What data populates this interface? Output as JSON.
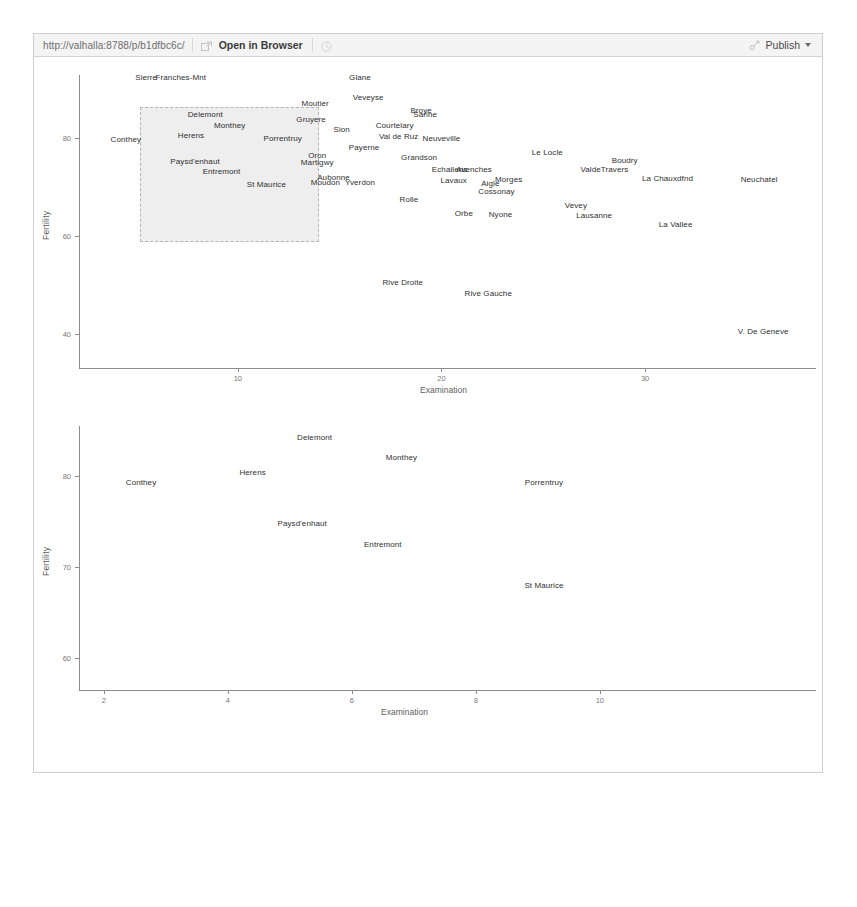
{
  "toolbar": {
    "url": "http://valhalla:8788/p/b1dfbc6c/",
    "open_in_browser_label": "Open in Browser",
    "publish_label": "Publish",
    "back_icon": "back-arrow-icon",
    "popout_icon": "popout-icon",
    "broom_icon": "broom-clear-icon",
    "publish_icon": "publish-icon",
    "caret_icon": "chevron-down-icon"
  },
  "charts": [
    {
      "id": "fertility-vs-examination-full",
      "type": "scatter",
      "title": "",
      "xlabel": "Examination",
      "ylabel": "Fertility",
      "xlim": [
        2.2,
        38.0
      ],
      "ylim": [
        33.0,
        93.0
      ],
      "xticks": [
        "10",
        "20",
        "30"
      ],
      "xtick_values": [
        10,
        20,
        30
      ],
      "yticks": [
        "80",
        "60",
        "40"
      ],
      "ytick_values": [
        80,
        60,
        40
      ],
      "grid": false,
      "legend": "none",
      "brush": {
        "x0": 5.2,
        "x1": 14.0,
        "y0": 58.9,
        "y1": 86.5
      },
      "points": [
        {
          "label": "Sierre",
          "x": 5.5,
          "y": 92.5
        },
        {
          "label": "Franches-Mnt",
          "x": 7.2,
          "y": 92.5
        },
        {
          "label": "Glane",
          "x": 16.0,
          "y": 92.5
        },
        {
          "label": "Moutier",
          "x": 13.8,
          "y": 87.2
        },
        {
          "label": "Veveyse",
          "x": 16.4,
          "y": 88.5
        },
        {
          "label": "Delemont",
          "x": 8.4,
          "y": 85.0
        },
        {
          "label": "Broye",
          "x": 19.0,
          "y": 85.9
        },
        {
          "label": "Sarine",
          "x": 19.2,
          "y": 85.1
        },
        {
          "label": "Gruyere",
          "x": 13.6,
          "y": 84.0
        },
        {
          "label": "Monthey",
          "x": 9.6,
          "y": 82.7
        },
        {
          "label": "Sion",
          "x": 15.1,
          "y": 82.0
        },
        {
          "label": "Courtelary",
          "x": 17.7,
          "y": 82.7
        },
        {
          "label": "Herens",
          "x": 7.7,
          "y": 80.8
        },
        {
          "label": "Val de Ruz",
          "x": 17.9,
          "y": 80.6
        },
        {
          "label": "Neuveville",
          "x": 20.0,
          "y": 80.1
        },
        {
          "label": "Conthey",
          "x": 4.5,
          "y": 79.8
        },
        {
          "label": "Porrentruy",
          "x": 12.2,
          "y": 80.1
        },
        {
          "label": "Payerne",
          "x": 16.2,
          "y": 78.3
        },
        {
          "label": "Oron",
          "x": 13.9,
          "y": 76.6
        },
        {
          "label": "Grandson",
          "x": 18.9,
          "y": 76.3
        },
        {
          "label": "Le Locle",
          "x": 25.2,
          "y": 77.3
        },
        {
          "label": "Martigwy",
          "x": 13.9,
          "y": 75.2
        },
        {
          "label": "Boudry",
          "x": 29.0,
          "y": 75.5
        },
        {
          "label": "Paysd'enhaut",
          "x": 7.9,
          "y": 75.3
        },
        {
          "label": "Echallens",
          "x": 20.4,
          "y": 73.8
        },
        {
          "label": "Avenches",
          "x": 21.6,
          "y": 73.8
        },
        {
          "label": "ValdeTravers",
          "x": 28.0,
          "y": 73.8
        },
        {
          "label": "Entremont",
          "x": 9.2,
          "y": 73.4
        },
        {
          "label": "Aubonne",
          "x": 14.7,
          "y": 72.2
        },
        {
          "label": "Moudon",
          "x": 14.3,
          "y": 71.1
        },
        {
          "label": "Yverdon",
          "x": 16.0,
          "y": 71.1
        },
        {
          "label": "Lavaux",
          "x": 20.6,
          "y": 71.5
        },
        {
          "label": "Morges",
          "x": 23.3,
          "y": 71.8
        },
        {
          "label": "Aigle",
          "x": 22.4,
          "y": 70.8
        },
        {
          "label": "La Chauxdfnd",
          "x": 31.1,
          "y": 72.0
        },
        {
          "label": "Neuchatel",
          "x": 35.6,
          "y": 71.8
        },
        {
          "label": "St Maurice",
          "x": 11.4,
          "y": 70.6
        },
        {
          "label": "Cossonay",
          "x": 22.7,
          "y": 69.2
        },
        {
          "label": "Rolle",
          "x": 18.4,
          "y": 67.7
        },
        {
          "label": "Vevey",
          "x": 26.6,
          "y": 66.3
        },
        {
          "label": "Orbe",
          "x": 21.1,
          "y": 64.8
        },
        {
          "label": "Nyone",
          "x": 22.9,
          "y": 64.5
        },
        {
          "label": "Lausanne",
          "x": 27.5,
          "y": 64.3
        },
        {
          "label": "La Vallee",
          "x": 31.5,
          "y": 62.5
        },
        {
          "label": "Rive Droite",
          "x": 18.1,
          "y": 50.6
        },
        {
          "label": "Rive Gauche",
          "x": 22.3,
          "y": 48.3
        },
        {
          "label": "V. De Geneve",
          "x": 35.8,
          "y": 40.6
        }
      ]
    },
    {
      "id": "fertility-vs-examination-zoom",
      "type": "scatter",
      "title": "",
      "xlabel": "Examination",
      "ylabel": "Fertility",
      "xlim": [
        1.6,
        12.1
      ],
      "ylim": [
        56.5,
        85.5
      ],
      "xticks": [
        "2",
        "4",
        "6",
        "8",
        "10"
      ],
      "xtick_values": [
        2,
        4,
        6,
        8,
        10
      ],
      "yticks": [
        "80",
        "70",
        "60"
      ],
      "ytick_values": [
        80,
        70,
        60
      ],
      "grid": false,
      "legend": "none",
      "points": [
        {
          "label": "Delemont",
          "x": 5.4,
          "y": 84.3
        },
        {
          "label": "Monthey",
          "x": 6.8,
          "y": 82.1
        },
        {
          "label": "Herens",
          "x": 4.4,
          "y": 80.5
        },
        {
          "label": "Conthey",
          "x": 2.6,
          "y": 79.4
        },
        {
          "label": "Porrentruy",
          "x": 9.1,
          "y": 79.4
        },
        {
          "label": "Paysd'enhaut",
          "x": 5.2,
          "y": 74.8
        },
        {
          "label": "Entremont",
          "x": 6.5,
          "y": 72.5
        },
        {
          "label": "St Maurice",
          "x": 9.1,
          "y": 68.0
        }
      ]
    }
  ]
}
